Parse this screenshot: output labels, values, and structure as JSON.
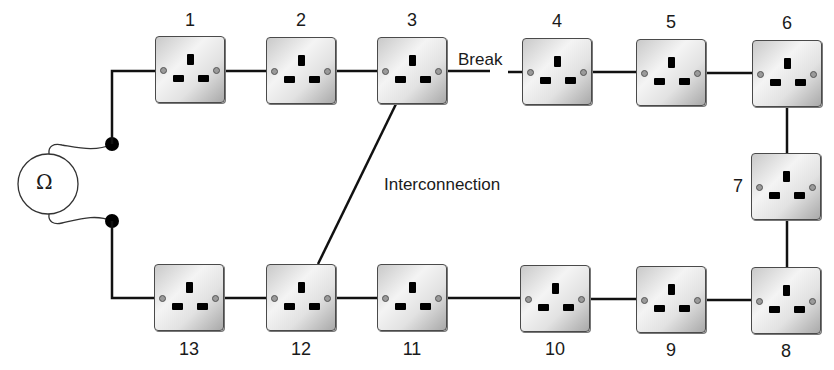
{
  "diagram": {
    "meter_symbol": "Ω",
    "annotations": {
      "break": "Break",
      "interconnection": "Interconnection"
    },
    "sockets": [
      {
        "id": "1",
        "label": "1"
      },
      {
        "id": "2",
        "label": "2"
      },
      {
        "id": "3",
        "label": "3"
      },
      {
        "id": "4",
        "label": "4"
      },
      {
        "id": "5",
        "label": "5"
      },
      {
        "id": "6",
        "label": "6"
      },
      {
        "id": "7",
        "label": "7"
      },
      {
        "id": "8",
        "label": "8"
      },
      {
        "id": "9",
        "label": "9"
      },
      {
        "id": "10",
        "label": "10"
      },
      {
        "id": "11",
        "label": "11"
      },
      {
        "id": "12",
        "label": "12"
      },
      {
        "id": "13",
        "label": "13"
      }
    ],
    "connections": [
      {
        "from": "meter",
        "to": "1"
      },
      {
        "from": "1",
        "to": "2"
      },
      {
        "from": "2",
        "to": "3"
      },
      {
        "from": "3",
        "to": "4",
        "status": "break"
      },
      {
        "from": "4",
        "to": "5"
      },
      {
        "from": "5",
        "to": "6"
      },
      {
        "from": "6",
        "to": "7"
      },
      {
        "from": "7",
        "to": "8"
      },
      {
        "from": "8",
        "to": "9"
      },
      {
        "from": "9",
        "to": "10"
      },
      {
        "from": "10",
        "to": "11"
      },
      {
        "from": "11",
        "to": "12"
      },
      {
        "from": "12",
        "to": "13"
      },
      {
        "from": "13",
        "to": "meter"
      },
      {
        "from": "3",
        "to": "12",
        "status": "interconnection"
      }
    ],
    "colors": {
      "line": "#111111",
      "socket_border": "#4a4a4a",
      "socket_face": "#e6e6e6",
      "background": "#ffffff"
    }
  }
}
